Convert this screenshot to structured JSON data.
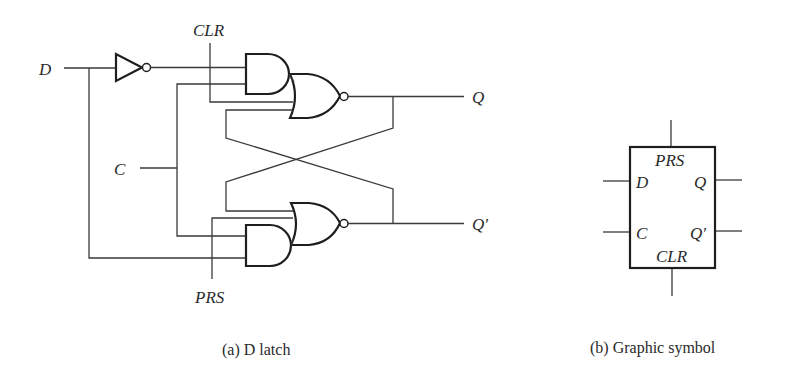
{
  "figure_a": {
    "caption": "(a)  D latch",
    "labels": {
      "d": "D",
      "c": "C",
      "clr": "CLR",
      "prs": "PRS",
      "q": "Q",
      "q_prime": "Q′"
    },
    "components": [
      "inverter",
      "and-gate-top",
      "nor-gate-top",
      "and-gate-bottom",
      "nor-gate-bottom"
    ]
  },
  "figure_b": {
    "caption": "(b)  Graphic symbol",
    "labels": {
      "prs": "PRS",
      "d": "D",
      "q": "Q",
      "c": "C",
      "q_prime": "Q′",
      "clr": "CLR"
    }
  },
  "colors": {
    "line": "#3a3a3a",
    "gate_outline": "#1e1e1e",
    "text": "#2a2a2a",
    "background": "#ffffff"
  }
}
